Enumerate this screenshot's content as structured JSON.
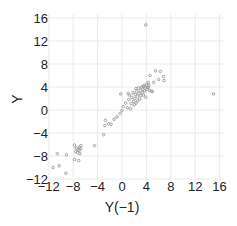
{
  "chart_data": {
    "type": "scatter",
    "title": "",
    "xlabel": "Y(−1)",
    "ylabel": "Y",
    "xlim": [
      -12,
      16
    ],
    "ylim": [
      -12,
      16
    ],
    "xticks": [
      -12,
      -8,
      -4,
      0,
      4,
      8,
      12,
      16
    ],
    "yticks": [
      -12,
      -8,
      -4,
      0,
      4,
      8,
      12,
      16
    ],
    "xtick_labels": [
      "−12",
      "−8",
      "−4",
      "0",
      "4",
      "8",
      "12",
      "16"
    ],
    "ytick_labels": [
      "−12",
      "−8",
      "−4",
      "0",
      "4",
      "8",
      "12",
      "16"
    ],
    "grid": true,
    "legend": null,
    "point_color": "#9a9a9a",
    "grid_color": "#ebebeb",
    "points": [
      [
        3.9,
        14.8
      ],
      [
        15.0,
        2.8
      ],
      [
        -11.3,
        -10.0
      ],
      [
        -10.3,
        -9.7
      ],
      [
        -9.2,
        -11.0
      ],
      [
        -10.6,
        -7.6
      ],
      [
        -9.1,
        -7.8
      ],
      [
        -7.8,
        -6.1
      ],
      [
        -7.5,
        -6.6
      ],
      [
        -7.2,
        -6.9
      ],
      [
        -7.0,
        -6.5
      ],
      [
        -7.6,
        -7.2
      ],
      [
        -7.3,
        -7.4
      ],
      [
        -7.0,
        -7.0
      ],
      [
        -6.7,
        -6.2
      ],
      [
        -6.9,
        -7.6
      ],
      [
        -7.8,
        -8.6
      ],
      [
        -7.1,
        -8.8
      ],
      [
        -6.8,
        -6.7
      ],
      [
        -4.5,
        -6.2
      ],
      [
        -3.0,
        -4.3
      ],
      [
        -2.8,
        -2.7
      ],
      [
        -2.7,
        -1.8
      ],
      [
        -2.2,
        -2.4
      ],
      [
        -1.8,
        -2.5
      ],
      [
        -1.3,
        -1.6
      ],
      [
        -0.8,
        -1.2
      ],
      [
        -0.3,
        -0.6
      ],
      [
        0.0,
        -0.1
      ],
      [
        0.2,
        0.6
      ],
      [
        -0.2,
        2.8
      ],
      [
        0.6,
        1.2
      ],
      [
        0.9,
        0.4
      ],
      [
        1.1,
        1.8
      ],
      [
        1.2,
        2.6
      ],
      [
        1.4,
        0.2
      ],
      [
        1.5,
        1.1
      ],
      [
        1.6,
        2.2
      ],
      [
        1.8,
        3.0
      ],
      [
        1.9,
        1.5
      ],
      [
        2.0,
        0.9
      ],
      [
        2.1,
        2.0
      ],
      [
        2.2,
        2.7
      ],
      [
        2.3,
        1.2
      ],
      [
        2.4,
        3.2
      ],
      [
        2.5,
        2.4
      ],
      [
        2.6,
        1.6
      ],
      [
        2.7,
        3.8
      ],
      [
        2.8,
        2.9
      ],
      [
        2.9,
        1.9
      ],
      [
        3.0,
        3.4
      ],
      [
        3.1,
        2.5
      ],
      [
        3.2,
        4.0
      ],
      [
        3.3,
        3.0
      ],
      [
        3.4,
        3.6
      ],
      [
        3.5,
        2.6
      ],
      [
        3.6,
        4.2
      ],
      [
        3.7,
        3.3
      ],
      [
        3.8,
        3.8
      ],
      [
        3.9,
        2.2
      ],
      [
        4.0,
        4.5
      ],
      [
        4.1,
        3.6
      ],
      [
        4.2,
        4.0
      ],
      [
        4.3,
        3.9
      ],
      [
        4.4,
        4.3
      ],
      [
        4.5,
        3.4
      ],
      [
        4.6,
        6.0
      ],
      [
        4.8,
        3.3
      ],
      [
        5.0,
        3.2
      ],
      [
        5.2,
        4.8
      ],
      [
        5.5,
        6.8
      ],
      [
        6.0,
        5.3
      ],
      [
        6.3,
        6.7
      ],
      [
        6.8,
        5.8
      ],
      [
        6.9,
        5.1
      ],
      [
        4.3,
        4.8
      ],
      [
        3.5,
        4.1
      ],
      [
        2.3,
        3.7
      ],
      [
        1.0,
        2.9
      ]
    ]
  }
}
